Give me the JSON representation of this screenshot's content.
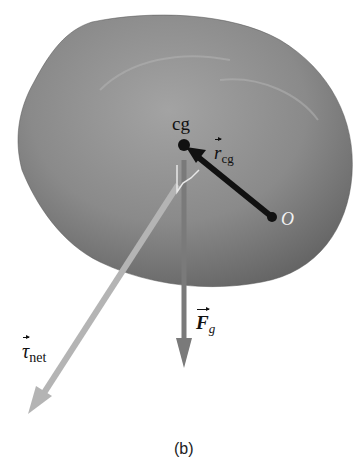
{
  "figure": {
    "panel_label": "(b)",
    "caption_label": "(b)",
    "object": "irregular-rock-body",
    "points": {
      "cg": {
        "label": "cg"
      },
      "origin": {
        "label": "O"
      }
    },
    "vectors": {
      "r_cg": {
        "symbol": "r",
        "subscript": "cg",
        "color": "#111111"
      },
      "F_g": {
        "symbol": "F",
        "subscript": "g",
        "color": "#7a7a7a"
      },
      "tau_net": {
        "symbol": "τ",
        "subscript": "net",
        "color": "#b4b4b4"
      }
    },
    "colors": {
      "rock_fill": "#7d7d7d",
      "background": "#ffffff"
    }
  }
}
